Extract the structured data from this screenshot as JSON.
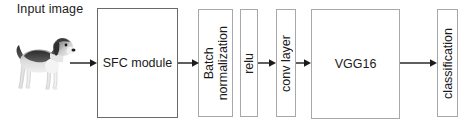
{
  "diagram": {
    "background_color": "#ffffff",
    "text_color": "#1b1b1b",
    "arrow_color": "#1b1b1b",
    "input": {
      "label": "Input\nimage",
      "image_alt": "grayscale photograph of a beagle dog standing in profile"
    },
    "blocks": [
      {
        "id": "sfc",
        "label": "SFC module",
        "orientation": "horizontal",
        "border_color": "#6a6a6a"
      },
      {
        "id": "bn",
        "label": "Batch\nnormalization",
        "orientation": "vertical",
        "border_color": "#a8a8a8"
      },
      {
        "id": "relu",
        "label": "relu",
        "orientation": "vertical",
        "border_color": "#a8a8a8"
      },
      {
        "id": "conv",
        "label": "conv layer",
        "orientation": "vertical",
        "border_color": "#a8a8a8"
      },
      {
        "id": "vgg",
        "label": "VGG16",
        "orientation": "horizontal",
        "border_color": "#a8a8a8"
      },
      {
        "id": "cls",
        "label": "classification",
        "orientation": "vertical",
        "border_color": "#a8a8a8"
      }
    ],
    "arrows": [
      {
        "id": "a1",
        "from": "input-image",
        "to": "sfc"
      },
      {
        "id": "a2",
        "from": "sfc",
        "to": "bn"
      },
      {
        "id": "a3",
        "from": "relu",
        "to": "conv"
      },
      {
        "id": "a4",
        "from": "conv",
        "to": "vgg"
      },
      {
        "id": "a5",
        "from": "vgg",
        "to": "cls"
      }
    ]
  }
}
